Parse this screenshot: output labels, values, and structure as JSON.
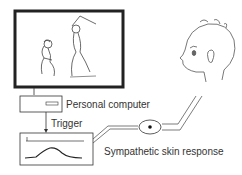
{
  "diagram": {
    "monitor": {
      "content": "video scene: person swinging bat at crouching person"
    },
    "computer": {
      "label": "Personal computer"
    },
    "trigger": {
      "label": "Trigger"
    },
    "recorder": {
      "content": "SSR waveform recording"
    },
    "electrode": {
      "label": "Sympathetic skin response"
    },
    "subject": {
      "content": "subject head (profile)"
    }
  }
}
